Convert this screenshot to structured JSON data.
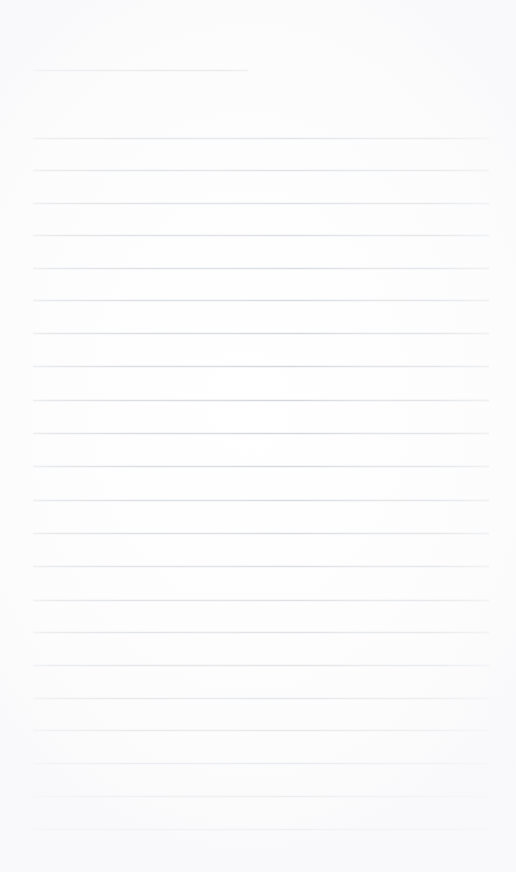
{
  "document": {
    "kind": "lined-paper-scan",
    "title": "Blank Lined Notepaper",
    "page_width": 516,
    "page_height": 872,
    "background_color": "#ffffff",
    "rule_color": "#cdd0d5",
    "rule_thickness_px": 1,
    "text_content": "",
    "visible_text": []
  },
  "layout": {
    "left_margin_px": 33,
    "right_edge_px": 489,
    "line_spacing_px": 32.7,
    "first_rule_y_px": 70,
    "body_first_rule_y_px": 138,
    "last_rule_y_px": 829,
    "bottom_blank_height_px": 43
  },
  "rules": [
    {
      "id": "rule-header",
      "y": 70,
      "x1": 33,
      "x2": 248,
      "short": true
    },
    {
      "id": "rule-01",
      "y": 138,
      "x1": 33,
      "x2": 489,
      "short": false
    },
    {
      "id": "rule-02",
      "y": 170,
      "x1": 33,
      "x2": 489,
      "short": false
    },
    {
      "id": "rule-03",
      "y": 202.5,
      "x1": 33,
      "x2": 489,
      "short": false
    },
    {
      "id": "rule-04",
      "y": 235,
      "x1": 33,
      "x2": 489,
      "short": false
    },
    {
      "id": "rule-05",
      "y": 267.5,
      "x1": 33,
      "x2": 489,
      "short": false
    },
    {
      "id": "rule-06",
      "y": 300,
      "x1": 33,
      "x2": 489,
      "short": false
    },
    {
      "id": "rule-07",
      "y": 333,
      "x1": 33,
      "x2": 489,
      "short": false
    },
    {
      "id": "rule-08",
      "y": 366,
      "x1": 33,
      "x2": 489,
      "short": false
    },
    {
      "id": "rule-09",
      "y": 400,
      "x1": 33,
      "x2": 489,
      "short": false
    },
    {
      "id": "rule-10",
      "y": 433,
      "x1": 33,
      "x2": 489,
      "short": false
    },
    {
      "id": "rule-11",
      "y": 466,
      "x1": 33,
      "x2": 489,
      "short": false
    },
    {
      "id": "rule-12",
      "y": 500,
      "x1": 33,
      "x2": 489,
      "short": false
    },
    {
      "id": "rule-13",
      "y": 533,
      "x1": 33,
      "x2": 489,
      "short": false
    },
    {
      "id": "rule-14",
      "y": 565.5,
      "x1": 33,
      "x2": 489,
      "short": false
    },
    {
      "id": "rule-15",
      "y": 600,
      "x1": 33,
      "x2": 489,
      "short": false
    },
    {
      "id": "rule-16",
      "y": 632,
      "x1": 33,
      "x2": 489,
      "short": false
    },
    {
      "id": "rule-17",
      "y": 665,
      "x1": 33,
      "x2": 489,
      "short": false
    },
    {
      "id": "rule-18",
      "y": 697.5,
      "x1": 33,
      "x2": 489,
      "short": false
    },
    {
      "id": "rule-19",
      "y": 730,
      "x1": 33,
      "x2": 489,
      "short": false
    },
    {
      "id": "rule-20",
      "y": 763,
      "x1": 33,
      "x2": 489,
      "short": false
    },
    {
      "id": "rule-21",
      "y": 796,
      "x1": 33,
      "x2": 489,
      "short": false
    },
    {
      "id": "rule-22",
      "y": 829,
      "x1": 33,
      "x2": 489,
      "short": false
    }
  ]
}
